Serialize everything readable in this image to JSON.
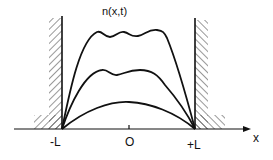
{
  "title": "n(x,t)",
  "axis": {
    "x_label": "x",
    "ticks": [
      {
        "label": "-L"
      },
      {
        "label": "O"
      },
      {
        "label": "+L"
      }
    ]
  },
  "curves": [
    {
      "name": "late-time profile",
      "shape": "flat-top with wiggles"
    },
    {
      "name": "intermediate profile",
      "shape": "double hump"
    },
    {
      "name": "early-time profile",
      "shape": "smooth arch"
    }
  ],
  "walls": [
    "left absorbing wall at -L",
    "right absorbing wall at +L"
  ],
  "colors": {
    "ink": "#111111",
    "background": "#ffffff"
  }
}
